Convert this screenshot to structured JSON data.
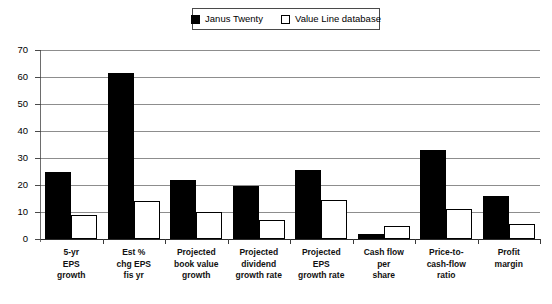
{
  "legend": {
    "position": "top-center",
    "entries": [
      {
        "label": "Janus Twenty",
        "marker": "filled-square",
        "color": "#000000"
      },
      {
        "label": "Value Line database",
        "marker": "hollow-square",
        "color": "#ffffff"
      }
    ]
  },
  "chart_data": {
    "type": "bar",
    "title": "",
    "subtitle": "",
    "xlabel": "",
    "ylabel": "",
    "ylim": [
      0,
      70
    ],
    "ytick_labels": [
      "70",
      "60",
      "50",
      "40",
      "30",
      "20",
      "10",
      "0"
    ],
    "yticks": [
      70,
      60,
      50,
      40,
      30,
      20,
      10,
      0
    ],
    "grid": true,
    "legend_position": "top-center",
    "categories": [
      "5-yr\nEPS\ngrowth",
      "Est %\nchg EPS\nfis yr",
      "Projected\nbook value\ngrowth",
      "Projected\ndividend\ngrowth rate",
      "Projected\nEPS\ngrowth rate",
      "Cash flow\nper\nshare",
      "Price-to-\ncash-flow\nratio",
      "Profit\nmargin"
    ],
    "category_lines": [
      [
        "5-yr",
        "EPS",
        "growth"
      ],
      [
        "Est %",
        "chg EPS",
        "fis yr"
      ],
      [
        "Projected",
        "book value",
        "growth"
      ],
      [
        "Projected",
        "dividend",
        "growth rate"
      ],
      [
        "Projected",
        "EPS",
        "growth rate"
      ],
      [
        "Cash flow",
        "per",
        "share"
      ],
      [
        "Price-to-",
        "cash-flow",
        "ratio"
      ],
      [
        "Profit",
        "margin"
      ]
    ],
    "series": [
      {
        "name": "Janus Twenty",
        "color": "#000000",
        "values": [
          25,
          61.5,
          22,
          19.5,
          25.5,
          2,
          33,
          16
        ]
      },
      {
        "name": "Value Line database",
        "color": "#ffffff",
        "values": [
          9,
          14,
          10,
          7,
          14.5,
          5,
          11,
          5.5
        ]
      }
    ]
  }
}
